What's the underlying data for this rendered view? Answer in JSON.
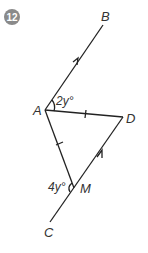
{
  "question": {
    "number": "12",
    "badge_color": "#8a8a8a"
  },
  "diagram": {
    "points": {
      "A": {
        "label": "A",
        "x": 45,
        "y": 110
      },
      "B": {
        "label": "B",
        "x": 103,
        "y": 25
      },
      "C": {
        "label": "C",
        "x": 50,
        "y": 222
      },
      "D": {
        "label": "D",
        "x": 123,
        "y": 117
      },
      "M": {
        "label": "M",
        "x": 74,
        "y": 188
      }
    },
    "segments": [
      "AB",
      "AD",
      "AM",
      "DM",
      "MC"
    ],
    "parallel_marks": [
      "AB",
      "CD"
    ],
    "equal_marks": [
      "AD",
      "AM"
    ],
    "angles": {
      "BAD": "2y°",
      "AMC": "4y°"
    }
  }
}
